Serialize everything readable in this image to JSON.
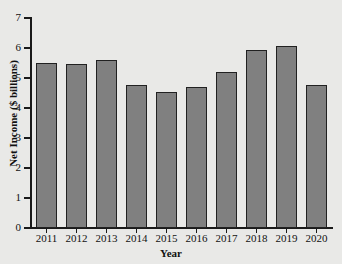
{
  "chart_data": {
    "type": "bar",
    "title": "",
    "xlabel": "Year",
    "ylabel": "Net Income ($ billions)",
    "categories": [
      "2011",
      "2012",
      "2013",
      "2014",
      "2015",
      "2016",
      "2017",
      "2018",
      "2019",
      "2020"
    ],
    "values": [
      5.5,
      5.47,
      5.6,
      4.78,
      4.55,
      4.71,
      5.2,
      5.95,
      6.07,
      4.77
    ],
    "ylim": [
      0,
      7
    ],
    "ytick_labels": [
      "0",
      "1",
      "2",
      "3",
      "4",
      "5",
      "6",
      "7"
    ],
    "ytick_values": [
      0,
      1,
      2,
      3,
      4,
      5,
      6,
      7
    ],
    "grid": false,
    "legend": null,
    "bar_color": "#808080",
    "bar_edge_color": "#212121",
    "background_color": "#e9e9e7",
    "axis_color": "#1a1a1a"
  }
}
